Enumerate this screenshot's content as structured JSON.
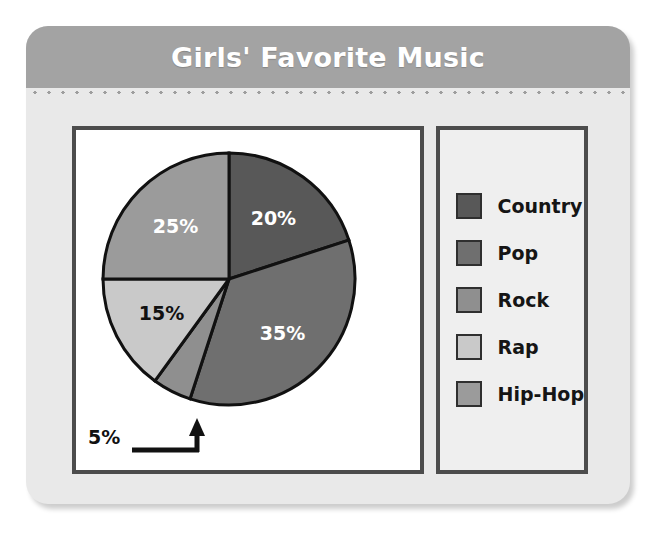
{
  "card": {
    "title": "Girls' Favorite Music",
    "header_color": "#a3a3a3",
    "body_color": "#e9e9e9",
    "title_color": "#ffffff",
    "panel_border_color": "#4c4c4c"
  },
  "legend": {
    "items": [
      {
        "label": "Country",
        "color": "#585858"
      },
      {
        "label": "Pop",
        "color": "#6f6f6f"
      },
      {
        "label": "Rock",
        "color": "#8f8f8f"
      },
      {
        "label": "Rap",
        "color": "#c9c9c9"
      },
      {
        "label": "Hip-Hop",
        "color": "#9b9b9b"
      }
    ]
  },
  "callout": {
    "label": "5%"
  },
  "chart_data": {
    "type": "pie",
    "title": "Girls' Favorite Music",
    "xlabel": "",
    "ylabel": "",
    "legend_position": "right",
    "grid": false,
    "start_angle_deg": 0,
    "direction": "clockwise",
    "categories": [
      "Country",
      "Pop",
      "Rock",
      "Rap",
      "Hip-Hop"
    ],
    "values": [
      20,
      35,
      5,
      15,
      25
    ],
    "labels": [
      "20%",
      "35%",
      "5%",
      "15%",
      "25%"
    ],
    "colors": [
      "#585858",
      "#6f6f6f",
      "#8f8f8f",
      "#c9c9c9",
      "#9b9b9b"
    ],
    "label_colors": [
      "#ffffff",
      "#ffffff",
      "#111111",
      "#111111",
      "#ffffff"
    ],
    "label_placement": [
      "inside",
      "inside",
      "outside",
      "inside",
      "inside"
    ],
    "units": "percent",
    "total": 100,
    "slices": [
      {
        "name": "Country",
        "value": 20,
        "label": "20%",
        "color": "#585858"
      },
      {
        "name": "Pop",
        "value": 35,
        "label": "35%",
        "color": "#6f6f6f"
      },
      {
        "name": "Rock",
        "value": 5,
        "label": "5%",
        "color": "#8f8f8f"
      },
      {
        "name": "Rap",
        "value": 15,
        "label": "15%",
        "color": "#c9c9c9"
      },
      {
        "name": "Hip-Hop",
        "value": 25,
        "label": "25%",
        "color": "#9b9b9b"
      }
    ]
  }
}
